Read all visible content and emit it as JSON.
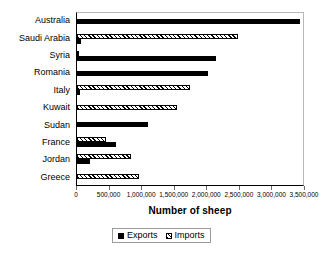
{
  "chart_data": {
    "type": "bar",
    "orientation": "horizontal",
    "title": "",
    "xlabel": "Number of sheep",
    "ylabel": "",
    "xlim": [
      0,
      3500000
    ],
    "grid": false,
    "legend_position": "bottom",
    "xticks": [
      0,
      500000,
      1000000,
      1500000,
      2000000,
      2500000,
      3000000,
      3500000
    ],
    "xtick_labels": [
      "0",
      "500,000",
      "1,000,000",
      "1,500,000",
      "2,000,000",
      "2,500,000",
      "3,000,000",
      "3,500,000"
    ],
    "categories": [
      "Australia",
      "Saudi Arabia",
      "Syria",
      "Romania",
      "Italy",
      "Kuwait",
      "Sudan",
      "France",
      "Jordan",
      "Greece"
    ],
    "series": [
      {
        "name": "Exports",
        "color": "#000000",
        "pattern": "solid",
        "values": [
          3450000,
          60000,
          2150000,
          2030000,
          50000,
          0,
          1100000,
          600000,
          200000,
          0
        ]
      },
      {
        "name": "Imports",
        "color": "#ffffff",
        "pattern": "diagonal-hatch",
        "values": [
          0,
          2500000,
          20000,
          0,
          1750000,
          1550000,
          0,
          450000,
          830000,
          960000
        ]
      }
    ]
  },
  "legend": {
    "items": [
      {
        "label": "Exports",
        "swatch": "solid-black-swatch"
      },
      {
        "label": "Imports",
        "swatch": "hatched-swatch"
      }
    ]
  },
  "colors": {
    "series_exports": "#000000",
    "series_imports": "#ffffff",
    "axis": "#000000",
    "plot_border_light": "#b8b8b8",
    "background": "#ffffff"
  }
}
